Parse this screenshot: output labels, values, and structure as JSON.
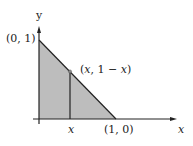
{
  "diagram": {
    "type": "coordinate-plot",
    "colors": {
      "fill": "#bdbdbd",
      "stroke": "#222222",
      "background": "#ffffff"
    },
    "axes": {
      "y_label": "y",
      "x_label": "x"
    },
    "points": {
      "top": "(0, 1)",
      "right": "(1, 0)",
      "on_line": "(x, 1 − x)"
    },
    "x_tick_label": "x"
  }
}
